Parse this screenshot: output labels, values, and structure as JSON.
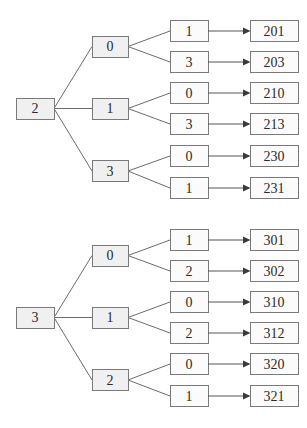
{
  "style": {
    "background": "#ffffff",
    "node_fill": "#f0f0f0",
    "leaf_fill": "#fbfbfb",
    "box_border": "#7a7a7a",
    "line_color": "#6b6b6b",
    "arrow_color": "#3a3a3a",
    "text_color": "#2a2a2a"
  },
  "trees": [
    {
      "root": "2",
      "branches": [
        {
          "label": "0",
          "children": [
            {
              "label": "1",
              "result": "201"
            },
            {
              "label": "3",
              "result": "203"
            }
          ]
        },
        {
          "label": "1",
          "children": [
            {
              "label": "0",
              "result": "210"
            },
            {
              "label": "3",
              "result": "213"
            }
          ]
        },
        {
          "label": "3",
          "children": [
            {
              "label": "0",
              "result": "230"
            },
            {
              "label": "1",
              "result": "231"
            }
          ]
        }
      ]
    },
    {
      "root": "3",
      "branches": [
        {
          "label": "0",
          "children": [
            {
              "label": "1",
              "result": "301"
            },
            {
              "label": "2",
              "result": "302"
            }
          ]
        },
        {
          "label": "1",
          "children": [
            {
              "label": "0",
              "result": "310"
            },
            {
              "label": "2",
              "result": "312"
            }
          ]
        },
        {
          "label": "2",
          "children": [
            {
              "label": "0",
              "result": "320"
            },
            {
              "label": "1",
              "result": "321"
            }
          ]
        }
      ]
    }
  ]
}
